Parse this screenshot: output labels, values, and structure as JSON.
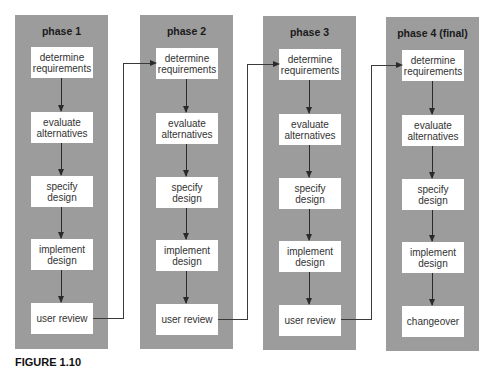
{
  "diagram": {
    "type": "iterative-development-phases",
    "colors": {
      "panel_fill": "#9c9c9c",
      "box_fill": "#ffffff",
      "arrow": "#2a2a2a"
    },
    "phases": [
      {
        "title": "phase 1",
        "steps": [
          {
            "line1": "determine",
            "line2": "requirements"
          },
          {
            "line1": "evaluate",
            "line2": "alternatives"
          },
          {
            "line1": "specify",
            "line2": "design"
          },
          {
            "line1": "implement",
            "line2": "design"
          },
          {
            "line1": "user review",
            "line2": ""
          }
        ]
      },
      {
        "title": "phase 2",
        "steps": [
          {
            "line1": "determine",
            "line2": "requirements"
          },
          {
            "line1": "evaluate",
            "line2": "alternatives"
          },
          {
            "line1": "specify",
            "line2": "design"
          },
          {
            "line1": "implement",
            "line2": "design"
          },
          {
            "line1": "user review",
            "line2": ""
          }
        ]
      },
      {
        "title": "phase 3",
        "steps": [
          {
            "line1": "determine",
            "line2": "requirements"
          },
          {
            "line1": "evaluate",
            "line2": "alternatives"
          },
          {
            "line1": "specify",
            "line2": "design"
          },
          {
            "line1": "implement",
            "line2": "design"
          },
          {
            "line1": "user review",
            "line2": ""
          }
        ]
      },
      {
        "title": "phase 4 (final)",
        "steps": [
          {
            "line1": "determine",
            "line2": "requirements"
          },
          {
            "line1": "evaluate",
            "line2": "alternatives"
          },
          {
            "line1": "specify",
            "line2": "design"
          },
          {
            "line1": "implement",
            "line2": "design"
          },
          {
            "line1": "changeover",
            "line2": ""
          }
        ]
      }
    ],
    "connectors": [
      {
        "from": "phase 1 / user review",
        "to": "phase 2 / determine requirements"
      },
      {
        "from": "phase 2 / user review",
        "to": "phase 3 / determine requirements"
      },
      {
        "from": "phase 3 / user review",
        "to": "phase 4 (final) / determine requirements"
      }
    ]
  },
  "caption": {
    "text": "FIGURE 1.10"
  }
}
